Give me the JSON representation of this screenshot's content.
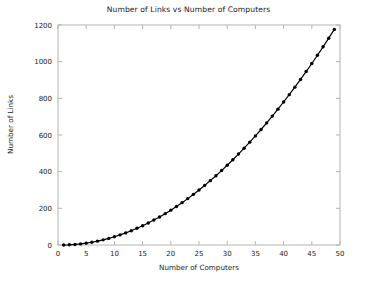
{
  "chart_data": {
    "type": "line",
    "title": "Number of Links vs Number of Computers",
    "xlabel": "Number of Computers",
    "ylabel": "Number of Links",
    "xlim": [
      0,
      50
    ],
    "ylim": [
      0,
      1200
    ],
    "grid": false,
    "legend": false,
    "marker": "filled-circle",
    "line_color": "#000000",
    "marker_color": "#000000",
    "axis_color": "#b4b4b4",
    "text_color": "#1a1a1a",
    "background_color": "#ffffff",
    "xticks": [
      0,
      5,
      10,
      15,
      20,
      25,
      30,
      35,
      40,
      45,
      50
    ],
    "yticks": [
      0,
      200,
      400,
      600,
      800,
      1000,
      1200
    ],
    "xtick_labels": [
      "0",
      "5",
      "10",
      "15",
      "20",
      "25",
      "30",
      "35",
      "40",
      "45",
      "50"
    ],
    "ytick_labels": [
      "0",
      "200",
      "400",
      "600",
      "800",
      "1000",
      "1200"
    ],
    "series": [
      {
        "name": "Number of Links",
        "x": [
          1,
          2,
          3,
          4,
          5,
          6,
          7,
          8,
          9,
          10,
          11,
          12,
          13,
          14,
          15,
          16,
          17,
          18,
          19,
          20,
          21,
          22,
          23,
          24,
          25,
          26,
          27,
          28,
          29,
          30,
          31,
          32,
          33,
          34,
          35,
          36,
          37,
          38,
          39,
          40,
          41,
          42,
          43,
          44,
          45,
          46,
          47,
          48,
          49,
          50
        ],
        "values": [
          0,
          1,
          3,
          6,
          10,
          15,
          21,
          28,
          36,
          45,
          55,
          66,
          78,
          91,
          105,
          120,
          136,
          153,
          171,
          190,
          210,
          231,
          253,
          276,
          300,
          325,
          351,
          378,
          406,
          435,
          465,
          496,
          528,
          561,
          595,
          630,
          666,
          703,
          741,
          780,
          820,
          861,
          903,
          946,
          990,
          1035,
          1081,
          1128,
          1176,
          1225
        ]
      }
    ]
  }
}
